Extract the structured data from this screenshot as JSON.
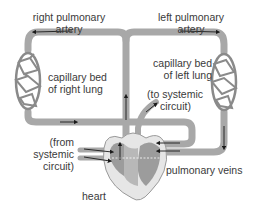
{
  "diagram": {
    "colors": {
      "vessel": "#a8a8a8",
      "vessel_edge": "#8a8a8a",
      "arrow": "#1a1a1a",
      "heart_outer": "#e6e6e6",
      "heart_inner": "#9c9c9c",
      "text": "#3a3a3a"
    },
    "labels": {
      "right_pulmonary_artery": [
        "right pulmonary",
        "artery"
      ],
      "left_pulmonary_artery": [
        "left pulmonary",
        "artery"
      ],
      "capillary_bed_right": [
        "capillary bed",
        "of right lung"
      ],
      "capillary_bed_left": [
        "capillary bed",
        "of left lung"
      ],
      "to_systemic": [
        "(to systemic",
        "circuit)"
      ],
      "from_systemic": [
        "(from",
        "systemic",
        "circuit)"
      ],
      "pulmonary_veins": "pulmonary veins",
      "heart": "heart"
    }
  }
}
